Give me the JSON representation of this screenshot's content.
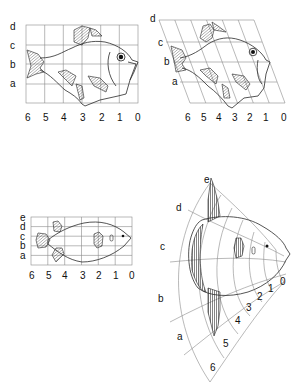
{
  "figure": {
    "panels": [
      {
        "id": "rectangular-grid-fish",
        "description": "Fish on rectangular coordinate grid",
        "row_labels": [
          "d",
          "c",
          "b",
          "a"
        ],
        "column_labels": [
          "6",
          "5",
          "4",
          "3",
          "2",
          "1",
          "0"
        ]
      },
      {
        "id": "sheared-grid-fish",
        "description": "Same fish transformed onto oblique (sheared) grid",
        "row_labels": [
          "d",
          "c",
          "b",
          "a"
        ],
        "column_labels": [
          "6",
          "5",
          "4",
          "3",
          "2",
          "1",
          "0"
        ]
      },
      {
        "id": "rectangular-grid-fish-2",
        "description": "Elongated fish (porcupinefish-like) on rectangular grid",
        "row_labels": [
          "e",
          "d",
          "c",
          "b",
          "a"
        ],
        "column_labels": [
          "6",
          "5",
          "4",
          "3",
          "2",
          "1",
          "0"
        ]
      },
      {
        "id": "radial-grid-sunfish",
        "description": "Sunfish (Mola) on curvilinear radial grid",
        "row_labels": [
          "e",
          "d",
          "c",
          "b",
          "a"
        ],
        "column_labels": [
          "6",
          "5",
          "4",
          "3",
          "2",
          "1",
          "0"
        ]
      }
    ]
  },
  "colors": {
    "grid": "#8a8a8a",
    "outline": "#2a2a2a",
    "fin_fill": "#bdbdbd",
    "background": "#ffffff"
  }
}
